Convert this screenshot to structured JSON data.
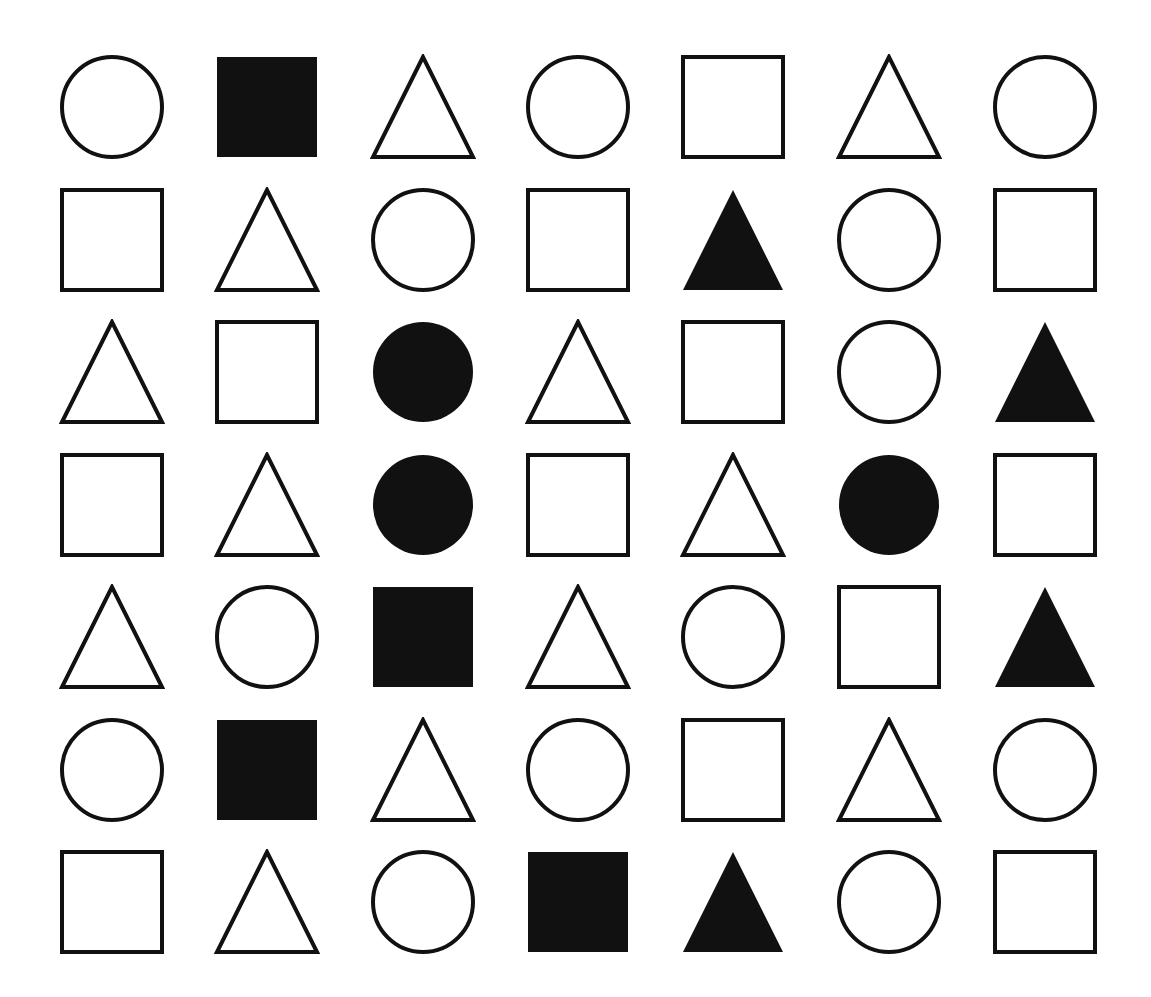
{
  "canvas": {
    "width": 1151,
    "height": 997,
    "background_color": "#ffffff",
    "ink_color": "#111111",
    "stroke_width": 4
  },
  "grid": {
    "rows": 7,
    "columns": 7,
    "column_centers_px": [
      112,
      267,
      423,
      578,
      733,
      889,
      1045
    ],
    "row_centers_px": [
      107,
      240,
      372,
      505,
      637,
      770,
      902
    ],
    "cell_size_px": 100
  },
  "legend": {
    "shape_names": [
      "circle",
      "square",
      "triangle"
    ],
    "fill_names": [
      "outline",
      "filled"
    ]
  },
  "chart_data": {
    "type": "table",
    "xlabel": "",
    "ylabel": "",
    "categories": [
      "col-1",
      "col-2",
      "col-3",
      "col-4",
      "col-5",
      "col-6",
      "col-7"
    ],
    "rows": [
      {
        "row_index": 1,
        "cells": [
          {
            "shape": "circle",
            "fill": "outline"
          },
          {
            "shape": "square",
            "fill": "filled"
          },
          {
            "shape": "triangle",
            "fill": "outline"
          },
          {
            "shape": "circle",
            "fill": "outline"
          },
          {
            "shape": "square",
            "fill": "outline"
          },
          {
            "shape": "triangle",
            "fill": "outline"
          },
          {
            "shape": "circle",
            "fill": "outline"
          }
        ]
      },
      {
        "row_index": 2,
        "cells": [
          {
            "shape": "square",
            "fill": "outline"
          },
          {
            "shape": "triangle",
            "fill": "outline"
          },
          {
            "shape": "circle",
            "fill": "outline"
          },
          {
            "shape": "square",
            "fill": "outline"
          },
          {
            "shape": "triangle",
            "fill": "filled"
          },
          {
            "shape": "circle",
            "fill": "outline"
          },
          {
            "shape": "square",
            "fill": "outline"
          }
        ]
      },
      {
        "row_index": 3,
        "cells": [
          {
            "shape": "triangle",
            "fill": "outline"
          },
          {
            "shape": "square",
            "fill": "outline"
          },
          {
            "shape": "circle",
            "fill": "filled"
          },
          {
            "shape": "triangle",
            "fill": "outline"
          },
          {
            "shape": "square",
            "fill": "outline"
          },
          {
            "shape": "circle",
            "fill": "outline"
          },
          {
            "shape": "triangle",
            "fill": "filled"
          }
        ]
      },
      {
        "row_index": 4,
        "cells": [
          {
            "shape": "square",
            "fill": "outline"
          },
          {
            "shape": "triangle",
            "fill": "outline"
          },
          {
            "shape": "circle",
            "fill": "filled"
          },
          {
            "shape": "square",
            "fill": "outline"
          },
          {
            "shape": "triangle",
            "fill": "outline"
          },
          {
            "shape": "circle",
            "fill": "filled"
          },
          {
            "shape": "square",
            "fill": "outline"
          }
        ]
      },
      {
        "row_index": 5,
        "cells": [
          {
            "shape": "triangle",
            "fill": "outline"
          },
          {
            "shape": "circle",
            "fill": "outline"
          },
          {
            "shape": "square",
            "fill": "filled"
          },
          {
            "shape": "triangle",
            "fill": "outline"
          },
          {
            "shape": "circle",
            "fill": "outline"
          },
          {
            "shape": "square",
            "fill": "outline"
          },
          {
            "shape": "triangle",
            "fill": "filled"
          }
        ]
      },
      {
        "row_index": 6,
        "cells": [
          {
            "shape": "circle",
            "fill": "outline"
          },
          {
            "shape": "square",
            "fill": "filled"
          },
          {
            "shape": "triangle",
            "fill": "outline"
          },
          {
            "shape": "circle",
            "fill": "outline"
          },
          {
            "shape": "square",
            "fill": "outline"
          },
          {
            "shape": "triangle",
            "fill": "outline"
          },
          {
            "shape": "circle",
            "fill": "outline"
          }
        ]
      },
      {
        "row_index": 7,
        "cells": [
          {
            "shape": "square",
            "fill": "outline"
          },
          {
            "shape": "triangle",
            "fill": "outline"
          },
          {
            "shape": "circle",
            "fill": "outline"
          },
          {
            "shape": "square",
            "fill": "filled"
          },
          {
            "shape": "triangle",
            "fill": "filled"
          },
          {
            "shape": "circle",
            "fill": "outline"
          },
          {
            "shape": "square",
            "fill": "outline"
          }
        ]
      }
    ],
    "counts": {
      "total_shapes": 49,
      "circles": 16,
      "squares": 17,
      "triangles": 16,
      "filled": 11,
      "outline": 38
    }
  }
}
